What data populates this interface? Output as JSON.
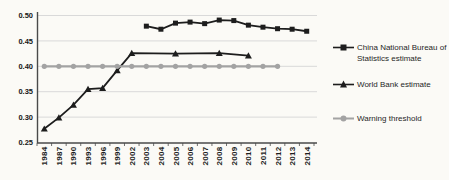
{
  "colors": {
    "background": "#fbfaf6",
    "grid": "#d9d9d9",
    "axis": "#4a4a4a",
    "tick_text": "#161616",
    "series_dark": "#1d1d1d",
    "series_gray": "#a3a3a3",
    "legend_text": "#1f1f1f"
  },
  "chart_data": {
    "type": "line",
    "title": "",
    "xlabel": "",
    "ylabel": "",
    "ylim": [
      0.25,
      0.5
    ],
    "y_ticks": [
      0.25,
      0.3,
      0.35,
      0.4,
      0.45,
      0.5
    ],
    "grid": "horizontal",
    "legend_position": "right",
    "x_categories": [
      "1984",
      "1987",
      "1990",
      "1993",
      "1996",
      "1999",
      "2002",
      "2003",
      "2004",
      "2005",
      "2006",
      "2007",
      "2008",
      "2009",
      "2010",
      "2011",
      "2012",
      "2013",
      "2014"
    ],
    "series": [
      {
        "name": "China National Bureau of Statistics estimate",
        "marker": "square",
        "color": "#1d1d1d",
        "x": [
          "2003",
          "2004",
          "2005",
          "2006",
          "2007",
          "2008",
          "2009",
          "2010",
          "2011",
          "2012",
          "2013",
          "2014"
        ],
        "y": [
          0.479,
          0.473,
          0.485,
          0.487,
          0.484,
          0.491,
          0.49,
          0.481,
          0.477,
          0.474,
          0.473,
          0.469
        ]
      },
      {
        "name": "World Bank estimate",
        "marker": "triangle",
        "color": "#1d1d1d",
        "x": [
          "1984",
          "1987",
          "1990",
          "1993",
          "1996",
          "1999",
          "2002",
          "2005",
          "2008",
          "2010"
        ],
        "y": [
          0.277,
          0.299,
          0.324,
          0.355,
          0.357,
          0.392,
          0.426,
          0.425,
          0.426,
          0.421
        ]
      },
      {
        "name": "Warning threshold",
        "marker": "circle",
        "color": "#a3a3a3",
        "x": [
          "1984",
          "1987",
          "1990",
          "1993",
          "1996",
          "1999",
          "2002",
          "2003",
          "2004",
          "2005",
          "2006",
          "2007",
          "2008",
          "2009",
          "2010",
          "2011",
          "2012"
        ],
        "y": [
          0.4,
          0.4,
          0.4,
          0.4,
          0.4,
          0.4,
          0.4,
          0.4,
          0.4,
          0.4,
          0.4,
          0.4,
          0.4,
          0.4,
          0.4,
          0.4,
          0.4
        ]
      }
    ]
  }
}
